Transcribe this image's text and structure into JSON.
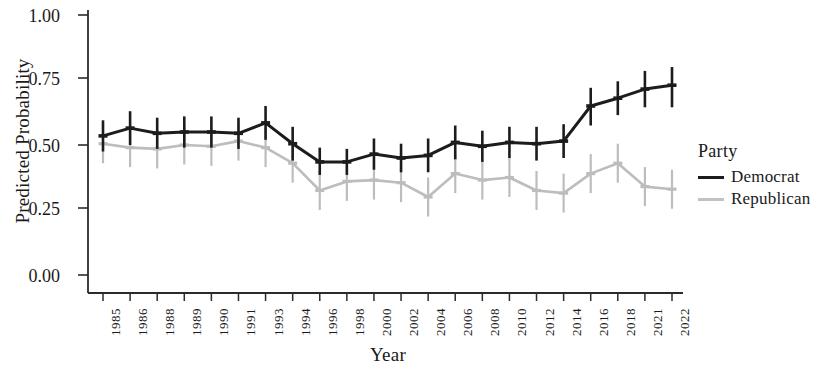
{
  "chart_data": {
    "type": "line",
    "title": "",
    "xlabel": "Year",
    "ylabel": "Predicted Probability",
    "ylim": [
      0.0,
      1.0
    ],
    "yticks": [
      "0.00",
      "0.25",
      "0.50",
      "0.75",
      "1.00"
    ],
    "ytick_values": [
      0.0,
      0.25,
      0.5,
      0.75,
      1.0
    ],
    "grid": false,
    "legend": {
      "title": "Party",
      "position": "right",
      "entries": [
        {
          "label": "Democrat",
          "color": "#1c1c1c"
        },
        {
          "label": "Republican",
          "color": "#bdbdbd"
        }
      ]
    },
    "categories": [
      "1985",
      "1986",
      "1988",
      "1989",
      "1990",
      "1991",
      "1993",
      "1994",
      "1996",
      "1998",
      "2000",
      "2002",
      "2004",
      "2006",
      "2008",
      "2010",
      "2012",
      "2014",
      "2016",
      "2018",
      "2021",
      "2022"
    ],
    "series": [
      {
        "name": "Democrat",
        "color": "#1c1c1c",
        "values": [
          0.535,
          0.565,
          0.545,
          0.55,
          0.55,
          0.545,
          0.585,
          0.505,
          0.435,
          0.435,
          0.465,
          0.45,
          0.46,
          0.51,
          0.495,
          0.51,
          0.505,
          0.515,
          0.65,
          0.68,
          0.715,
          0.73
        ],
        "error_low": [
          0.475,
          0.5,
          0.485,
          0.49,
          0.49,
          0.485,
          0.52,
          0.44,
          0.385,
          0.385,
          0.405,
          0.395,
          0.395,
          0.445,
          0.435,
          0.45,
          0.44,
          0.45,
          0.575,
          0.615,
          0.645,
          0.645
        ],
        "error_high": [
          0.595,
          0.63,
          0.605,
          0.61,
          0.61,
          0.605,
          0.65,
          0.57,
          0.49,
          0.485,
          0.525,
          0.505,
          0.525,
          0.575,
          0.555,
          0.57,
          0.57,
          0.58,
          0.72,
          0.745,
          0.785,
          0.8
        ]
      },
      {
        "name": "Republican",
        "color": "#bdbdbd",
        "values": [
          0.505,
          0.49,
          0.485,
          0.5,
          0.495,
          0.515,
          0.49,
          0.43,
          0.325,
          0.36,
          0.365,
          0.355,
          0.3,
          0.39,
          0.365,
          0.375,
          0.325,
          0.315,
          0.39,
          0.43,
          0.34,
          0.33
        ]
      }
    ]
  }
}
